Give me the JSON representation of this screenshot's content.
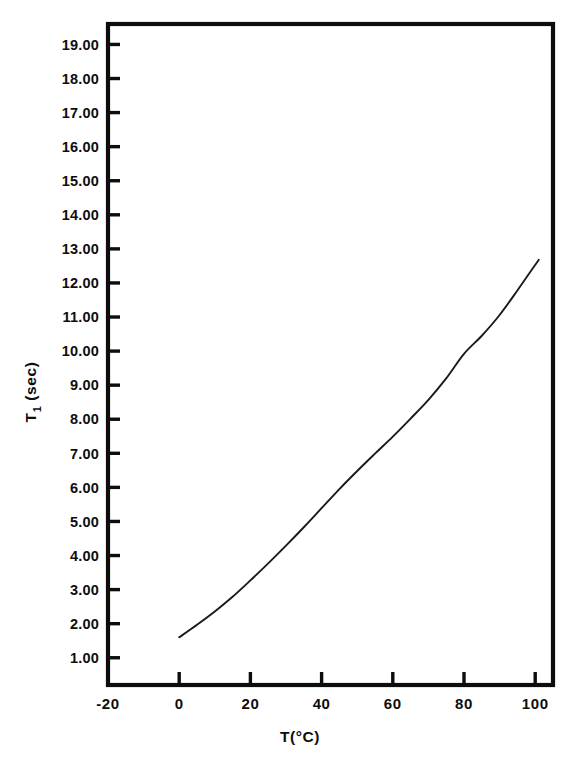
{
  "chart_data": {
    "type": "line",
    "title": "",
    "subtitle": "",
    "xlabel": "T(°C)",
    "ylabel": "T₁ (sec)",
    "ylabel_main": "T",
    "ylabel_sub": "1",
    "ylabel_unit": " (sec)",
    "xlim": [
      -20,
      105
    ],
    "ylim": [
      0.2,
      19.6
    ],
    "grid": false,
    "legend": null,
    "line_color": "#1a1a1a",
    "axis_color": "#0d0d0d",
    "background": "#ffffff",
    "x_ticks": [
      0,
      20,
      40,
      60,
      80,
      100
    ],
    "x_tick_labels": [
      "0",
      "20",
      "40",
      "60",
      "80",
      "100"
    ],
    "x_extra_labels": [
      {
        "value": -20,
        "label": "-20",
        "has_tick": false
      }
    ],
    "y_ticks": [
      1,
      2,
      3,
      4,
      5,
      6,
      7,
      8,
      9,
      10,
      11,
      12,
      13,
      14,
      15,
      16,
      17,
      18,
      19
    ],
    "y_tick_labels": [
      "1.00",
      "2.00",
      "3.00",
      "4.00",
      "5.00",
      "6.00",
      "7.00",
      "8.00",
      "9.00",
      "10.00",
      "11.00",
      "12.00",
      "13.00",
      "14.00",
      "15.00",
      "16.00",
      "17.00",
      "18.00",
      "19.00"
    ],
    "series": [
      {
        "name": "T1 relaxation time vs temperature",
        "x": [
          0,
          5,
          10,
          15,
          20,
          25,
          30,
          35,
          40,
          45,
          50,
          55,
          60,
          65,
          70,
          75,
          80,
          85,
          90,
          95,
          101
        ],
        "y": [
          1.6,
          1.97,
          2.36,
          2.79,
          3.27,
          3.77,
          4.29,
          4.83,
          5.39,
          5.95,
          6.48,
          6.99,
          7.49,
          8.02,
          8.57,
          9.2,
          9.92,
          10.45,
          11.06,
          11.78,
          12.68
        ]
      }
    ]
  }
}
